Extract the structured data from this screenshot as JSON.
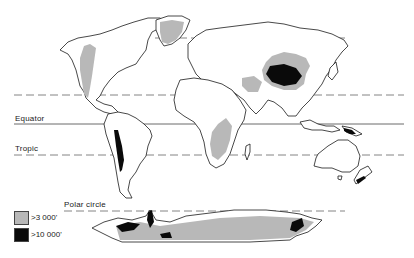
{
  "map": {
    "title": "",
    "lines": {
      "arctic_circle": {
        "y": 38,
        "style": "dashed"
      },
      "tropic_north": {
        "y": 95,
        "style": "dashed"
      },
      "equator": {
        "label": "Equator",
        "y": 124,
        "style": "solid"
      },
      "tropic_south": {
        "label": "Tropic",
        "y": 155,
        "style": "dashed"
      },
      "polar_circle": {
        "label": "Polar circle",
        "y": 211,
        "style": "dashed"
      }
    },
    "legend": {
      "items": [
        {
          "label": ">3 000'",
          "color": "#b8b8b8"
        },
        {
          "label": ">10 000'",
          "color": "#0a0a0a"
        }
      ]
    },
    "colors": {
      "land_outline": "#1a1a1a",
      "elevation_3000": "#b8b8b8",
      "elevation_10000": "#0a0a0a",
      "background": "#ffffff"
    }
  }
}
